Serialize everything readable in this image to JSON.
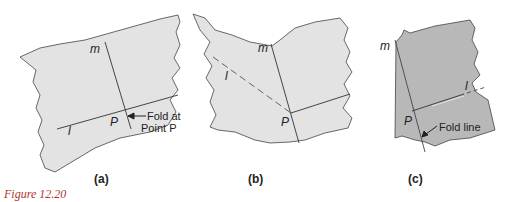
{
  "figure": {
    "caption": "Figure 12.20",
    "colors": {
      "paper_light": "#e3e3e3",
      "paper_dark": "#b8b8b8",
      "line": "#333333",
      "caption": "#b0352a"
    },
    "panels": [
      {
        "id": "a",
        "sublabel": "(a)",
        "labels": {
          "m": "m",
          "l": "l",
          "p": "P",
          "annotation_line1": "Fold at",
          "annotation_line2": "Point P"
        }
      },
      {
        "id": "b",
        "sublabel": "(b)",
        "labels": {
          "m": "m",
          "l": "l",
          "p": "P"
        }
      },
      {
        "id": "c",
        "sublabel": "(c)",
        "labels": {
          "m": "m",
          "l": "l",
          "p": "P",
          "annotation": "Fold line"
        }
      }
    ]
  }
}
